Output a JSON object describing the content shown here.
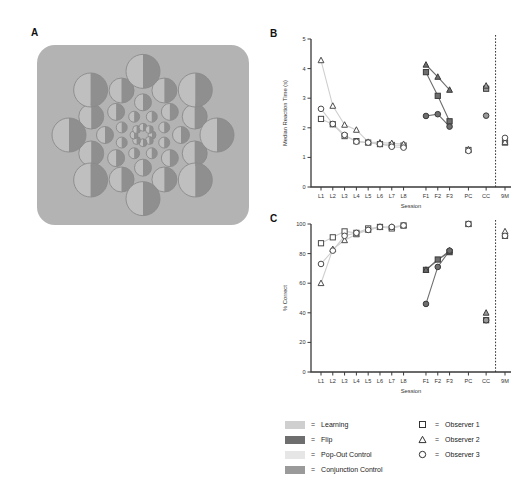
{
  "panels": {
    "a": {
      "letter": "A"
    },
    "b": {
      "letter": "B"
    },
    "c": {
      "letter": "C"
    }
  },
  "stimulus": {
    "name": "radial-circle-array",
    "background_color": "#b3b3b3",
    "circle_left_half_color": "#bfbfbf",
    "circle_right_half_color": "#8f8f8f",
    "outline_color": "#8a8a8a"
  },
  "legend": {
    "conditions": [
      {
        "label": "Learning",
        "color": "#cfcfcf"
      },
      {
        "label": "Flip",
        "color": "#6e6e6e"
      },
      {
        "label": "Pop-Out Control",
        "color": "#e6e6e6"
      },
      {
        "label": "Conjunction Control",
        "color": "#9a9a9a"
      }
    ],
    "observers": [
      {
        "label": "Observer 1",
        "marker": "square"
      },
      {
        "label": "Observer 2",
        "marker": "triangle"
      },
      {
        "label": "Observer 3",
        "marker": "circle"
      }
    ],
    "equals": "="
  },
  "chart_data": [
    {
      "type": "scatter",
      "panel": "B",
      "title": "",
      "xlabel": "Session",
      "ylabel": "Median Reaction Time (s)",
      "categories": [
        "L1",
        "L2",
        "L3",
        "L4",
        "L5",
        "L6",
        "L7",
        "L8",
        "F1",
        "F2",
        "F3",
        "PC",
        "CC",
        "9M"
      ],
      "yticks": [
        0,
        1,
        2,
        3,
        4,
        5
      ],
      "ylim": [
        0,
        5
      ],
      "grid": false,
      "divider_after": "CC",
      "series": [
        {
          "name": "Observer 1",
          "marker": "square",
          "values": [
            2.3,
            2.12,
            1.72,
            1.55,
            1.5,
            1.45,
            1.42,
            1.4,
            3.88,
            3.08,
            2.22,
            1.25,
            3.32,
            1.5
          ]
        },
        {
          "name": "Observer 2",
          "marker": "triangle",
          "values": [
            4.28,
            2.74,
            2.1,
            1.93,
            1.52,
            1.5,
            1.48,
            1.45,
            4.13,
            3.72,
            3.28,
            1.27,
            3.42,
            1.52
          ]
        },
        {
          "name": "Observer 3",
          "marker": "circle",
          "values": [
            2.64,
            2.13,
            1.76,
            1.53,
            1.5,
            1.45,
            1.36,
            1.33,
            2.4,
            2.46,
            2.04,
            1.22,
            2.41,
            1.66
          ]
        }
      ],
      "segments": [
        {
          "condition": "Learning",
          "from": "L1",
          "to": "L8"
        },
        {
          "condition": "Flip",
          "from": "F1",
          "to": "F3"
        }
      ]
    },
    {
      "type": "scatter",
      "panel": "C",
      "title": "",
      "xlabel": "Session",
      "ylabel": "% Correct",
      "categories": [
        "L1",
        "L2",
        "L3",
        "L4",
        "L5",
        "L6",
        "L7",
        "L8",
        "F1",
        "F2",
        "F3",
        "PC",
        "CC",
        "9M"
      ],
      "yticks": [
        0,
        20,
        40,
        60,
        80,
        100
      ],
      "ylim": [
        0,
        100
      ],
      "grid": false,
      "divider_after": "CC",
      "series": [
        {
          "name": "Observer 1",
          "marker": "square",
          "values": [
            87,
            91,
            95,
            94,
            97,
            98,
            97,
            99,
            69,
            76,
            81,
            100,
            35,
            92
          ]
        },
        {
          "name": "Observer 2",
          "marker": "triangle",
          "values": [
            60,
            83,
            89,
            93,
            96,
            98,
            98,
            99,
            69,
            null,
            82,
            100,
            40,
            95
          ]
        },
        {
          "name": "Observer 3",
          "marker": "circle",
          "values": [
            73,
            82,
            92,
            94,
            96,
            98,
            98,
            99,
            46,
            71,
            82,
            100,
            35,
            92
          ]
        }
      ],
      "segments": [
        {
          "condition": "Learning",
          "from": "L1",
          "to": "L8"
        },
        {
          "condition": "Flip",
          "from": "F1",
          "to": "F3"
        }
      ]
    }
  ]
}
